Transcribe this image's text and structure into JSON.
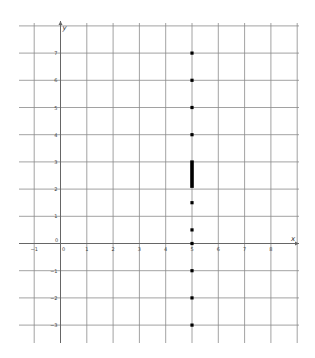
{
  "chart_data": {
    "type": "scatter",
    "title": "",
    "xlabel": "x",
    "ylabel": "y",
    "xlim": [
      -1.5,
      9
    ],
    "ylim": [
      -3.6,
      8
    ],
    "grid": true,
    "legend": null,
    "x_ticks": [
      -1,
      0,
      1,
      2,
      3,
      4,
      5,
      6,
      7,
      8
    ],
    "y_ticks": [
      -3,
      -2,
      -1,
      1,
      2,
      3,
      4,
      5,
      6,
      7
    ],
    "origin_label": "0",
    "series": [
      {
        "name": "points",
        "color": "#000000",
        "points": [
          {
            "x": 5,
            "y": 7
          },
          {
            "x": 5,
            "y": 6
          },
          {
            "x": 5,
            "y": 5
          },
          {
            "x": 5,
            "y": 4
          },
          {
            "x": 5,
            "y": 1.5
          },
          {
            "x": 5,
            "y": 0.5
          },
          {
            "x": 5,
            "y": 0
          },
          {
            "x": 5,
            "y": -1
          },
          {
            "x": 5,
            "y": -2
          },
          {
            "x": 5,
            "y": -3
          }
        ],
        "dense_segment": {
          "x": 5,
          "y_from": 2.1,
          "y_to": 3.0
        }
      }
    ]
  },
  "colors": {
    "grid": "#8a8a8a",
    "axis": "#666666",
    "points": "#000000",
    "background": "#ffffff"
  }
}
